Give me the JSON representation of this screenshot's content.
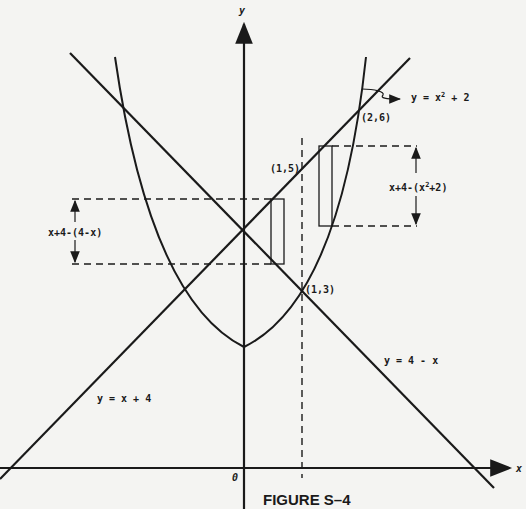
{
  "figure": {
    "caption": "FIGURE S–4",
    "axis_labels": {
      "x": "x",
      "y": "y",
      "origin": "0"
    },
    "curves": [
      {
        "name": "parabola",
        "equation": "y = x² + 2",
        "label": "y = x² + 2"
      },
      {
        "name": "line-increasing",
        "equation": "y = x + 4",
        "label": "y = x + 4"
      },
      {
        "name": "line-decreasing",
        "equation": "y = 4 - x",
        "label": "y = 4 - x"
      }
    ],
    "points": [
      {
        "label": "(1,5)",
        "x": 1,
        "y": 5
      },
      {
        "label": "(1,3)",
        "x": 1,
        "y": 3
      },
      {
        "label": "(2,6)",
        "x": 2,
        "y": 6
      }
    ],
    "strip_labels": {
      "left": "x+4-(4-x)",
      "right": "x+4-(x²+2)"
    },
    "vertical_dashed_line": {
      "x": 1
    },
    "labels": {
      "y_eq_x2_plus_2_prefix": "y = x",
      "y_eq_x2_plus_2_exp": "2",
      "y_eq_x2_plus_2_suffix": " + 2",
      "y_eq_x_plus_4": "y = x + 4",
      "y_eq_4_minus_x": "y = 4 - x",
      "pt_1_5": "(1,5)",
      "pt_1_3": "(1,3)",
      "pt_2_6": "(2,6)",
      "strip_left": "x+4-(4-x)",
      "strip_right_prefix": "x+4-(x",
      "strip_right_exp": "2",
      "strip_right_suffix": "+2)"
    }
  },
  "colors": {
    "ink": "#1a1a1a",
    "paper": "#f4f4f2"
  }
}
